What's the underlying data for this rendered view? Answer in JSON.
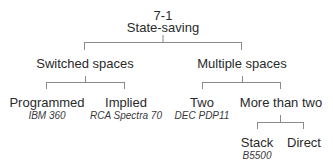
{
  "diagram": {
    "type": "tree",
    "root": {
      "number": "7-1",
      "label": "State-saving"
    },
    "level1": [
      {
        "label": "Switched spaces"
      },
      {
        "label": "Multiple spaces"
      }
    ],
    "level2": [
      {
        "parent": "Switched spaces",
        "label": "Programmed",
        "example": "IBM 360"
      },
      {
        "parent": "Switched spaces",
        "label": "Implied",
        "example": "RCA Spectra 70"
      },
      {
        "parent": "Multiple spaces",
        "label": "Two",
        "example": "DEC PDP11"
      },
      {
        "parent": "Multiple spaces",
        "label": "More than two",
        "example": ""
      }
    ],
    "level3": [
      {
        "parent": "More than two",
        "label": "Stack",
        "example": "B5500"
      },
      {
        "parent": "More than two",
        "label": "Direct",
        "example": ""
      }
    ],
    "colors": {
      "line": "#8a8a8a",
      "text": "#2a2a2a"
    }
  }
}
